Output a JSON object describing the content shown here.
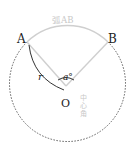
{
  "diagram": {
    "points": {
      "A": {
        "label": "A",
        "x": 22,
        "y": 38
      },
      "B": {
        "label": "B",
        "x": 112,
        "y": 38
      },
      "O": {
        "label": "O",
        "x": 66,
        "y": 100
      }
    },
    "labels": {
      "arc": "弧AB",
      "radius": "r",
      "angle": "a°",
      "central_angle": "中心角",
      "central_angle_chars": [
        "中",
        "心",
        "角"
      ]
    },
    "colors": {
      "main": "#333333",
      "light": "#c8c8c8",
      "dashed": "#555555"
    }
  }
}
